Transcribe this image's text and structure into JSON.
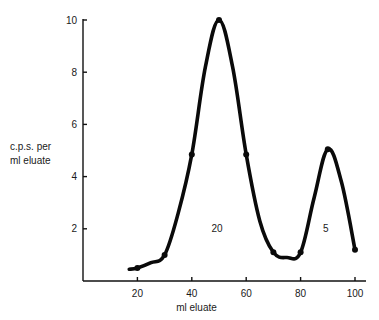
{
  "chart_data": {
    "type": "line",
    "title": "",
    "xlabel": "ml eluate",
    "ylabel": "c.p.s. per ml eluate",
    "ylabel_lines": [
      "c.p.s. per",
      "ml eluate"
    ],
    "xlim": [
      0,
      104
    ],
    "ylim": [
      0,
      10
    ],
    "x_ticks": [
      20,
      40,
      60,
      80,
      100
    ],
    "y_ticks": [
      2,
      4,
      6,
      8,
      10
    ],
    "grid": false,
    "legend": null,
    "series": [
      {
        "name": "radioactivity",
        "curve_x": [
          17,
          20,
          25,
          30,
          35,
          40,
          45,
          50,
          55,
          60,
          65,
          70,
          75,
          80,
          85,
          90,
          95,
          100
        ],
        "curve_y": [
          0.45,
          0.5,
          0.7,
          1.0,
          2.6,
          4.85,
          8.2,
          10.0,
          8.2,
          4.85,
          2.3,
          1.1,
          0.9,
          1.1,
          3.2,
          5.05,
          3.8,
          1.2
        ],
        "markers_x": [
          20,
          30,
          40,
          50,
          60,
          70,
          80,
          90,
          100
        ],
        "markers_y": [
          0.5,
          1.0,
          4.85,
          10.0,
          4.85,
          1.1,
          1.1,
          5.05,
          1.2
        ]
      }
    ],
    "annotations": [
      {
        "text": "20",
        "x": 50,
        "y": 2.0
      },
      {
        "text": "5",
        "x": 90,
        "y": 2.0
      }
    ]
  }
}
